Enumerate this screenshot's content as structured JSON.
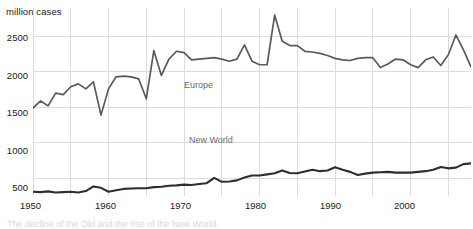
{
  "chart_data": {
    "type": "line",
    "title": "",
    "ylabel": "million cases",
    "xlabel": "",
    "ylim": [
      250,
      2900
    ],
    "xlim": [
      1950,
      2008
    ],
    "yticks": [
      500,
      1000,
      1500,
      2000,
      2500
    ],
    "xticks": [
      1950,
      1960,
      1970,
      1980,
      1990,
      2000
    ],
    "grid": true,
    "grid_x_step": 5,
    "legend": "inline-labels",
    "series": [
      {
        "name": "Europe",
        "color": "#5a5a5a",
        "x": [
          1950,
          1951,
          1952,
          1953,
          1954,
          1955,
          1956,
          1957,
          1958,
          1959,
          1960,
          1961,
          1962,
          1963,
          1964,
          1965,
          1966,
          1967,
          1968,
          1969,
          1970,
          1971,
          1972,
          1973,
          1974,
          1975,
          1976,
          1977,
          1978,
          1979,
          1980,
          1981,
          1982,
          1983,
          1984,
          1985,
          1986,
          1987,
          1988,
          1989,
          1990,
          1991,
          1992,
          1993,
          1994,
          1995,
          1996,
          1997,
          1998,
          1999,
          2000,
          2001,
          2002,
          2003,
          2004,
          2005,
          2006,
          2007,
          2008
        ],
        "values": [
          1490,
          1590,
          1520,
          1700,
          1680,
          1790,
          1830,
          1760,
          1860,
          1390,
          1760,
          1930,
          1940,
          1930,
          1900,
          1620,
          2300,
          1950,
          2180,
          2290,
          2270,
          2170,
          2180,
          2190,
          2200,
          2180,
          2150,
          2180,
          2380,
          2150,
          2100,
          2100,
          2800,
          2430,
          2370,
          2370,
          2290,
          2280,
          2260,
          2230,
          2190,
          2170,
          2160,
          2190,
          2200,
          2200,
          2060,
          2110,
          2180,
          2170,
          2100,
          2060,
          2170,
          2210,
          2090,
          2240,
          2520,
          2310,
          2070
        ]
      },
      {
        "name": "New World",
        "color": "#2e2e2e",
        "x": [
          1950,
          1951,
          1952,
          1953,
          1954,
          1955,
          1956,
          1957,
          1958,
          1959,
          1960,
          1961,
          1962,
          1963,
          1964,
          1965,
          1966,
          1967,
          1968,
          1969,
          1970,
          1971,
          1972,
          1973,
          1974,
          1975,
          1976,
          1977,
          1978,
          1979,
          1980,
          1981,
          1982,
          1983,
          1984,
          1985,
          1986,
          1987,
          1988,
          1989,
          1990,
          1991,
          1992,
          1993,
          1994,
          1995,
          1996,
          1997,
          1998,
          1999,
          2000,
          2001,
          2002,
          2003,
          2004,
          2005,
          2006,
          2007,
          2008
        ],
        "values": [
          310,
          305,
          315,
          300,
          305,
          310,
          300,
          320,
          385,
          365,
          310,
          330,
          350,
          355,
          360,
          360,
          375,
          380,
          395,
          400,
          410,
          405,
          420,
          430,
          505,
          450,
          455,
          470,
          510,
          540,
          540,
          555,
          570,
          610,
          575,
          570,
          595,
          620,
          600,
          610,
          655,
          620,
          590,
          545,
          565,
          580,
          585,
          590,
          580,
          580,
          580,
          590,
          600,
          620,
          660,
          640,
          650,
          700,
          710
        ]
      }
    ],
    "annotations": [
      {
        "text": "Europe",
        "x": 1974,
        "y": 1400
      },
      {
        "text": "New World",
        "x": 1975,
        "y": 660
      }
    ]
  },
  "axes": {
    "y_unit_label": "million cases",
    "ytick_labels": [
      "2500",
      "2000",
      "1500",
      "1000",
      "500"
    ],
    "xtick_labels": [
      "1950",
      "1960",
      "1970",
      "1980",
      "1990",
      "2000"
    ]
  },
  "labels": {
    "europe": "Europe",
    "new_world": "New World"
  },
  "caption": {
    "text": "The decline of the Old and the rise of the New World."
  }
}
